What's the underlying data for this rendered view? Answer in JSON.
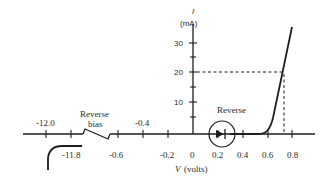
{
  "diagram": {
    "type": "diode I-V characteristic",
    "y_axis": {
      "symbol": "I",
      "unit": "(mA)",
      "ticks": [
        {
          "label": "30",
          "value": 30
        },
        {
          "label": "20",
          "value": 20
        },
        {
          "label": "10",
          "value": 10
        }
      ]
    },
    "x_axis": {
      "symbol": "V",
      "unit": "(volts)",
      "ticks_positive": [
        {
          "label": "0",
          "value": 0
        },
        {
          "label": "0.2",
          "value": 0.2
        },
        {
          "label": "0.4",
          "value": 0.4
        },
        {
          "label": "0.6",
          "value": 0.6
        },
        {
          "label": "0.8",
          "value": 0.8
        }
      ],
      "ticks_negative": [
        {
          "label": "-0.2",
          "value": -0.2
        },
        {
          "label": "-0.4",
          "value": -0.4
        },
        {
          "label": "-0.6",
          "value": -0.6
        },
        {
          "label": "-11.8",
          "value": -11.8
        },
        {
          "label": "-12.0",
          "value": -12.0
        }
      ]
    },
    "annotations": {
      "reverse_bias_line1": "Reverse",
      "reverse_bias_line2": "bias",
      "forward_region_label": "Reverse"
    },
    "reference_point": {
      "V": 0.7,
      "I": 20
    },
    "colors": {
      "line": "#1e1e1e",
      "text": "#2a2a2a",
      "background": "#ffffff"
    }
  }
}
